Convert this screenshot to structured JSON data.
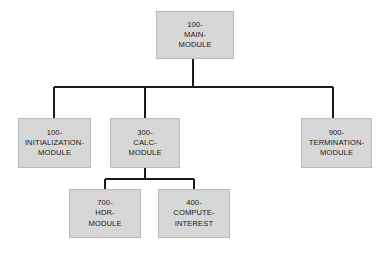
{
  "diagram": {
    "type": "structure-chart",
    "background_color": "#ffffff",
    "box_fill_color": "#d7d7d7",
    "box_border_color": "#b9b9b9",
    "connector_color": "#1a1a1a",
    "text_color": "#1a1a1a"
  },
  "nodes": [
    {
      "id": "main",
      "level": 0,
      "lines": [
        "100-",
        "MAIN-",
        "MODULE"
      ],
      "full_label": "100-MAIN-MODULE",
      "x": 156,
      "y": 11,
      "width": 78,
      "height": 48
    },
    {
      "id": "initialization",
      "level": 1,
      "lines": [
        "100-",
        "INITIALIZATION-",
        "MODULE"
      ],
      "full_label": "100-INITIALIZATION-MODULE",
      "x": 18,
      "y": 118,
      "width": 73,
      "height": 50
    },
    {
      "id": "calc",
      "level": 1,
      "lines": [
        "300-",
        "CALC-",
        "MODULE"
      ],
      "full_label": "300-CALC-MODULE",
      "x": 110,
      "y": 118,
      "width": 70,
      "height": 50
    },
    {
      "id": "termination",
      "level": 1,
      "lines": [
        "900-",
        "TERMINATION-",
        "MODULE"
      ],
      "full_label": "900-TERMINATION-MODULE",
      "x": 301,
      "y": 118,
      "width": 71,
      "height": 50
    },
    {
      "id": "hdr",
      "level": 2,
      "lines": [
        "700-",
        "HDR-",
        "MODULE"
      ],
      "full_label": "700-HDR-MODULE",
      "x": 69,
      "y": 189,
      "width": 72,
      "height": 49
    },
    {
      "id": "compute-interest",
      "level": 2,
      "lines": [
        "400-",
        "COMPUTE-",
        "INTEREST"
      ],
      "full_label": "400-COMPUTE-INTEREST",
      "x": 158,
      "y": 189,
      "width": 72,
      "height": 49
    }
  ],
  "edges": [
    {
      "from": "main",
      "to": "initialization"
    },
    {
      "from": "main",
      "to": "calc"
    },
    {
      "from": "main",
      "to": "termination"
    },
    {
      "from": "calc",
      "to": "hdr"
    },
    {
      "from": "calc",
      "to": "compute-interest"
    }
  ],
  "connectors": {
    "upper": {
      "trunk_x": 193,
      "trunk_top": 59,
      "bus_y": 87,
      "bus_left": 54,
      "bus_right": 333,
      "drop_xs": [
        54,
        145,
        333
      ],
      "drop_bottom": 118
    },
    "lower": {
      "trunk_x": 145,
      "trunk_top": 168,
      "bus_y": 179,
      "bus_left": 105,
      "bus_right": 194,
      "drop_xs": [
        105,
        194
      ],
      "drop_bottom": 189
    }
  }
}
